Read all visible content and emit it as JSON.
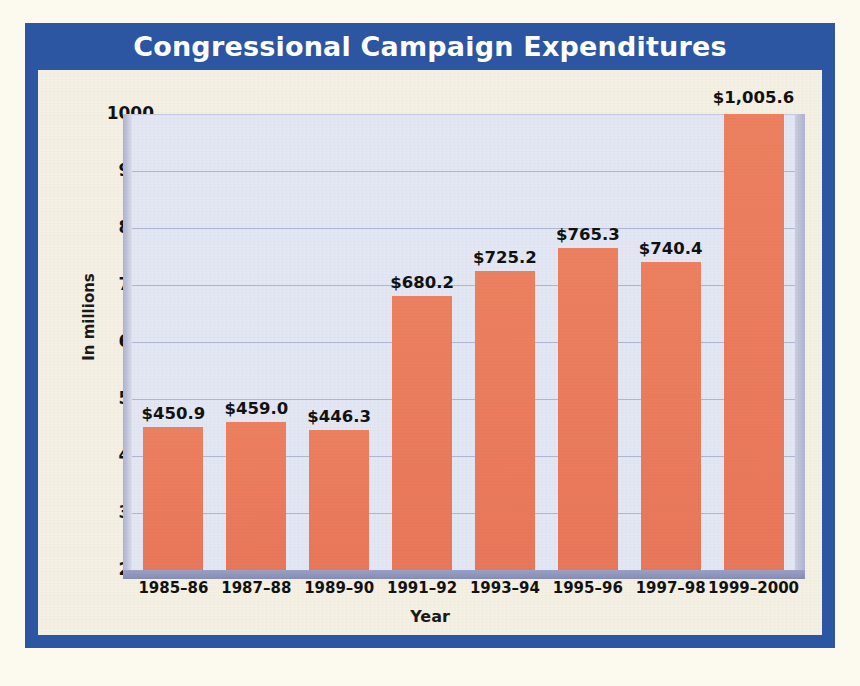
{
  "figure": {
    "title": "Congressional Campaign Expenditures",
    "source": "Source: Federal Election Commission",
    "title_band_color": "#2C55A2",
    "frame_color": "#2C55A2",
    "panel_color": "#F4F1E4",
    "plot_background_color": "#E3E7F3",
    "bar_color": "#EC7D5F",
    "gridline_color": "#AEB6D2"
  },
  "chart_data": {
    "type": "bar",
    "title": "Congressional Campaign Expenditures",
    "xlabel": "Year",
    "ylabel": "In millions",
    "categories": [
      "1985–86",
      "1987–88",
      "1989–90",
      "1991–92",
      "1993–94",
      "1995–96",
      "1997–98",
      "1999–2000"
    ],
    "values": [
      450.9,
      459.0,
      446.3,
      680.2,
      725.2,
      765.3,
      740.4,
      1005.6
    ],
    "value_labels": [
      "$450.9",
      "$459.0",
      "$446.3",
      "$680.2",
      "$725.2",
      "$765.3",
      "$740.4",
      "$1,005.6"
    ],
    "ylim": [
      200,
      1000
    ],
    "ytick_labels": [
      "1000",
      "900",
      "800",
      "700",
      "600",
      "500",
      "400",
      "300",
      "200"
    ],
    "ytick_values": [
      1000,
      900,
      800,
      700,
      600,
      500,
      400,
      300,
      200
    ],
    "grid": true,
    "legend": null,
    "series_name": "Congressional campaign expenditures"
  }
}
